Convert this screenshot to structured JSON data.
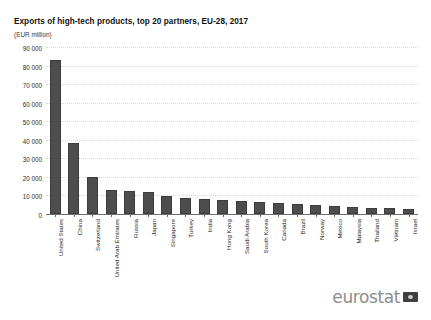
{
  "chart_data": {
    "type": "bar",
    "title": "Exports of high-tech products, top 20 partners, EU-28, 2017",
    "subtitle": "(EUR million)",
    "xlabel": "",
    "ylabel": "",
    "unit": "EUR million",
    "ylim": [
      0,
      90000
    ],
    "ytick_labels": [
      "90 000",
      "80 000",
      "70 000",
      "60 000",
      "50 000",
      "40 000",
      "30 000",
      "20 000",
      "10 000",
      "0"
    ],
    "ytick_values": [
      90000,
      80000,
      70000,
      60000,
      50000,
      40000,
      30000,
      20000,
      10000,
      0
    ],
    "grid": true,
    "legend": false,
    "categories": [
      "United States",
      "China",
      "Switzerland",
      "United Arab Emirates",
      "Russia",
      "Japan",
      "Singapore",
      "Turkey",
      "India",
      "Hong Kong",
      "Saudi Arabia",
      "South Korea",
      "Canada",
      "Brazil",
      "Norway",
      "Mexico",
      "Malaysia",
      "Thailand",
      "Vietnam",
      "Israel"
    ],
    "values": [
      83000,
      38500,
      20000,
      13000,
      12500,
      12000,
      9500,
      8500,
      8000,
      7500,
      7000,
      6500,
      6000,
      5500,
      5000,
      4500,
      4000,
      3500,
      3000,
      2500
    ],
    "bar_color": "#4d4d4d",
    "grid_color": "#d8d8d8",
    "axis_color": "#6f6f6f"
  },
  "footer": {
    "logo_text": "eurostat",
    "logo_flag": "eu-flag-icon"
  }
}
